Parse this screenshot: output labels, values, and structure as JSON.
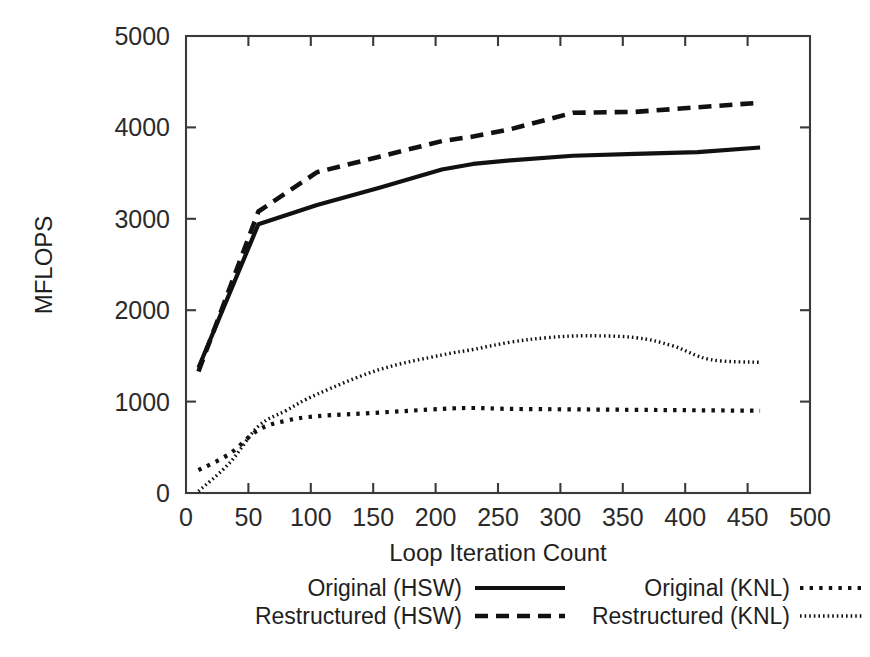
{
  "chart_data": {
    "type": "line",
    "title": "",
    "xlabel": "Loop Iteration Count",
    "ylabel": "MFLOPS",
    "xlim": [
      0,
      500
    ],
    "ylim": [
      0,
      5000
    ],
    "xticks": [
      0,
      50,
      100,
      150,
      200,
      250,
      300,
      350,
      400,
      450,
      500
    ],
    "xtick_labels": [
      "0",
      "50",
      "100",
      "150",
      "200",
      "250",
      "300",
      "350",
      "400",
      "450",
      "500"
    ],
    "yticks": [
      0,
      1000,
      2000,
      3000,
      4000,
      5000
    ],
    "ytick_labels": [
      "0",
      "1000",
      "2000",
      "3000",
      "4000",
      "5000"
    ],
    "grid": false,
    "legend_position": "below-axes",
    "series": [
      {
        "name": "Original (HSW)",
        "style": "solid",
        "color": "#111111",
        "x": [
          10,
          58,
          105,
          155,
          205,
          230,
          260,
          310,
          360,
          410,
          460
        ],
        "y": [
          1370,
          2940,
          3150,
          3340,
          3540,
          3600,
          3640,
          3690,
          3710,
          3730,
          3780
        ]
      },
      {
        "name": "Restructured (HSW)",
        "style": "dashed",
        "color": "#111111",
        "x": [
          10,
          58,
          105,
          155,
          205,
          230,
          260,
          310,
          360,
          410,
          460
        ],
        "y": [
          1330,
          3080,
          3510,
          3680,
          3850,
          3900,
          3980,
          4160,
          4170,
          4220,
          4270
        ]
      },
      {
        "name": "Original (KNL)",
        "style": "dotted",
        "color": "#111111",
        "x": [
          10,
          35,
          58,
          80,
          105,
          155,
          205,
          230,
          260,
          310,
          360,
          410,
          460
        ],
        "y": [
          250,
          430,
          690,
          790,
          840,
          880,
          920,
          930,
          920,
          915,
          910,
          905,
          900
        ]
      },
      {
        "name": "Restructured (KNL)",
        "style": "fine-dotted",
        "color": "#111111",
        "x": [
          10,
          35,
          58,
          80,
          105,
          155,
          205,
          230,
          260,
          290,
          320,
          360,
          390,
          420,
          460
        ],
        "y": [
          20,
          330,
          730,
          900,
          1080,
          1350,
          1510,
          1570,
          1650,
          1700,
          1720,
          1700,
          1610,
          1460,
          1430
        ]
      }
    ],
    "legend": [
      {
        "label": "Original (HSW)",
        "style": "solid"
      },
      {
        "label": "Restructured (HSW)",
        "style": "dashed"
      },
      {
        "label": "Original (KNL)",
        "style": "dotted"
      },
      {
        "label": "Restructured (KNL)",
        "style": "fine-dotted"
      }
    ]
  }
}
